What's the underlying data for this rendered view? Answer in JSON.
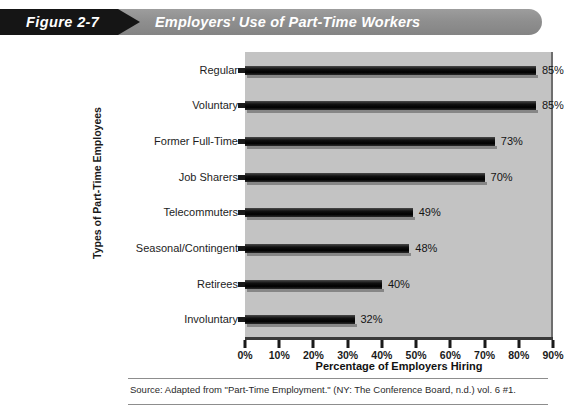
{
  "banner": {
    "figure_label": "Figure 2-7",
    "title": "Employers' Use of Part-Time Workers"
  },
  "source": {
    "note": "Source: Adapted from \"Part-Time Employment.\" (NY: The Conference Board, n.d.) vol. 6 #1."
  },
  "chart_data": {
    "type": "bar",
    "orientation": "horizontal",
    "title": "Employers' Use of Part-Time Workers",
    "xlabel": "Percentage of Employers Hiring",
    "ylabel": "Types of Part-Time Employees",
    "categories": [
      "Regular",
      "Voluntary",
      "Former Full-Time",
      "Job Sharers",
      "Telecommuters",
      "Seasonal/Contingent",
      "Retirees",
      "Involuntary"
    ],
    "values": [
      85,
      85,
      73,
      70,
      49,
      48,
      40,
      32
    ],
    "value_labels": [
      "85%",
      "85%",
      "73%",
      "70%",
      "49%",
      "48%",
      "40%",
      "32%"
    ],
    "xlim": [
      0,
      90
    ],
    "xticks": [
      0,
      10,
      20,
      30,
      40,
      50,
      60,
      70,
      80,
      90
    ],
    "xtick_labels": [
      "0%",
      "10%",
      "20%",
      "30%",
      "40%",
      "50%",
      "60%",
      "70%",
      "80%",
      "90%"
    ],
    "grid": false,
    "legend": null,
    "plot_background": "#c3c3c3",
    "bar_color": "#000000"
  }
}
